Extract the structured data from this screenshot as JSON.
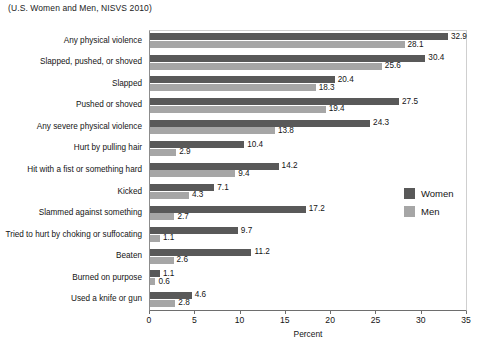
{
  "chart_data": {
    "type": "bar",
    "orientation": "horizontal",
    "title": "(U.S. Women and Men, NISVS 2010)",
    "xlabel": "Percent",
    "ylabel": "",
    "xlim": [
      0,
      35
    ],
    "xticks": [
      0,
      5,
      10,
      15,
      20,
      25,
      30,
      35
    ],
    "grid": false,
    "legend_position": "right",
    "categories": [
      "Any physical violence",
      "Slapped, pushed, or shoved",
      "Slapped",
      "Pushed or shoved",
      "Any severe physical violence",
      "Hurt by pulling hair",
      "Hit with a fist or something hard",
      "Kicked",
      "Slammed against something",
      "Tried to hurt by choking or suffocating",
      "Beaten",
      "Burned on purpose",
      "Used a knife or gun"
    ],
    "series": [
      {
        "name": "Women",
        "color": "#595959",
        "values": [
          32.9,
          30.4,
          20.4,
          27.5,
          24.3,
          10.4,
          14.2,
          7.1,
          17.2,
          9.7,
          11.2,
          1.1,
          4.6
        ]
      },
      {
        "name": "Men",
        "color": "#a6a6a6",
        "values": [
          28.1,
          25.6,
          18.3,
          19.4,
          13.8,
          2.9,
          9.4,
          4.3,
          2.7,
          1.1,
          2.6,
          0.6,
          2.8
        ]
      }
    ]
  }
}
